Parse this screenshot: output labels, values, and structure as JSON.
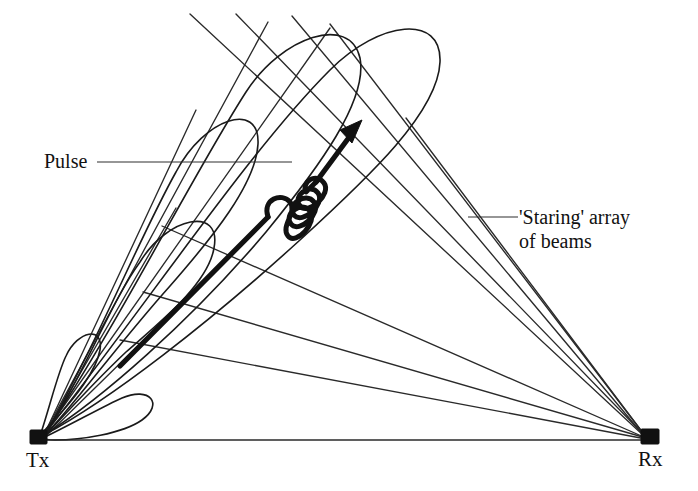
{
  "diagram": {
    "type": "bistatic-radar-beam-diagram",
    "background_color": "#ffffff",
    "ink_color": "#111111",
    "width": 698,
    "height": 491,
    "nodes": [
      {
        "id": "tx",
        "label": "Tx",
        "x": 38,
        "y": 438,
        "shape": "filled-square"
      },
      {
        "id": "rx",
        "label": "Rx",
        "x": 650,
        "y": 437,
        "shape": "filled-square"
      }
    ],
    "callouts": [
      {
        "id": "pulse",
        "label": "Pulse",
        "leader_from": [
          97,
          162
        ],
        "leader_to": [
          292,
          162
        ]
      },
      {
        "id": "staring-array",
        "label_line_1": "'Staring' array",
        "label_line_2": "of beams",
        "leader_from": [
          468,
          217
        ],
        "leader_to": [
          518,
          217
        ]
      }
    ],
    "pulse_arrow": {
      "description": "thick pulse arrow with sinusoidal wave packet",
      "start": [
        120,
        366
      ],
      "end": [
        362,
        121
      ],
      "wave_cycles": 4
    },
    "beam_lobes": {
      "count": 5,
      "origin": "tx",
      "description": "teardrop antenna beam lobes radiating from Tx"
    },
    "beam_fan": {
      "count": 8,
      "converge_at": "rx",
      "description": "staring array of beams converging at Rx"
    },
    "baseline": {
      "from": [
        46,
        440
      ],
      "to": [
        644,
        440
      ]
    }
  }
}
